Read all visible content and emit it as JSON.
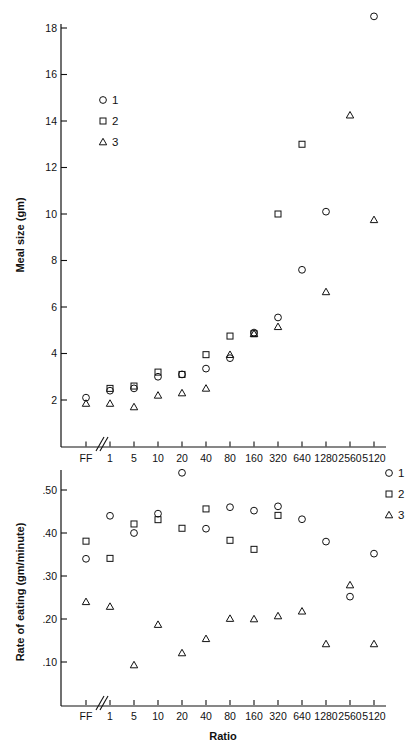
{
  "figure": {
    "xlabel": "Ratio",
    "background": "#ffffff",
    "ink": "#111111"
  },
  "chart_data": [
    {
      "id": "meal-size",
      "type": "scatter",
      "title": "",
      "xlabel": "",
      "ylabel": "Meal size (gm)",
      "x_tick_labels": [
        "FF",
        "1",
        "5",
        "10",
        "20",
        "40",
        "80",
        "160",
        "320",
        "640",
        "1280",
        "2560",
        "5120"
      ],
      "x_axis_break_after": "FF",
      "x_scale": "log2-categorical",
      "y_tick_labels": [
        "2",
        "4",
        "6",
        "8",
        "10",
        "12",
        "14",
        "16",
        "18"
      ],
      "y_tick_values": [
        2,
        4,
        6,
        8,
        10,
        12,
        14,
        16,
        18
      ],
      "ylim": [
        0,
        19
      ],
      "grid": false,
      "legend_position": "upper-left-inside",
      "legend": [
        {
          "label": "1",
          "marker": "circle"
        },
        {
          "label": "2",
          "marker": "square"
        },
        {
          "label": "3",
          "marker": "triangle"
        }
      ],
      "series": [
        {
          "name": "1",
          "marker": "circle",
          "points": [
            {
              "x": "FF",
              "y": 2.1
            },
            {
              "x": "1",
              "y": 2.4
            },
            {
              "x": "5",
              "y": 2.5
            },
            {
              "x": "10",
              "y": 3.0
            },
            {
              "x": "20",
              "y": 3.1
            },
            {
              "x": "40",
              "y": 3.35
            },
            {
              "x": "80",
              "y": 3.8
            },
            {
              "x": "160",
              "y": 4.9
            },
            {
              "x": "320",
              "y": 5.55
            },
            {
              "x": "640",
              "y": 7.6
            },
            {
              "x": "1280",
              "y": 10.1
            },
            {
              "x": "5120",
              "y": 18.5
            }
          ]
        },
        {
          "name": "2",
          "marker": "square",
          "points": [
            {
              "x": "1",
              "y": 2.5
            },
            {
              "x": "5",
              "y": 2.6
            },
            {
              "x": "10",
              "y": 3.2
            },
            {
              "x": "20",
              "y": 3.1
            },
            {
              "x": "40",
              "y": 3.95
            },
            {
              "x": "80",
              "y": 4.75
            },
            {
              "x": "160",
              "y": 4.85
            },
            {
              "x": "320",
              "y": 10.0
            },
            {
              "x": "640",
              "y": 13.0
            }
          ]
        },
        {
          "name": "3",
          "marker": "triangle",
          "points": [
            {
              "x": "FF",
              "y": 1.85
            },
            {
              "x": "1",
              "y": 1.85
            },
            {
              "x": "5",
              "y": 1.7
            },
            {
              "x": "10",
              "y": 2.2
            },
            {
              "x": "20",
              "y": 2.3
            },
            {
              "x": "40",
              "y": 2.5
            },
            {
              "x": "80",
              "y": 3.95
            },
            {
              "x": "160",
              "y": 4.85
            },
            {
              "x": "320",
              "y": 5.15
            },
            {
              "x": "1280",
              "y": 6.65
            },
            {
              "x": "2560",
              "y": 14.25
            },
            {
              "x": "5120",
              "y": 9.75
            }
          ]
        }
      ]
    },
    {
      "id": "rate-of-eating",
      "type": "scatter",
      "title": "",
      "xlabel": "Ratio",
      "ylabel": "Rate of eating (gm/minute)",
      "x_tick_labels": [
        "FF",
        "1",
        "5",
        "10",
        "20",
        "40",
        "80",
        "160",
        "320",
        "640",
        "1280",
        "2560",
        "5120"
      ],
      "x_axis_break_after": "FF",
      "x_scale": "log2-categorical",
      "y_tick_labels": [
        ".10",
        ".20",
        ".30",
        ".40",
        ".50"
      ],
      "y_tick_values": [
        0.1,
        0.2,
        0.3,
        0.4,
        0.5
      ],
      "ylim": [
        0.0,
        0.57
      ],
      "grid": false,
      "legend_position": "upper-right-outside",
      "legend": [
        {
          "label": "1",
          "marker": "circle"
        },
        {
          "label": "2",
          "marker": "square"
        },
        {
          "label": "3",
          "marker": "triangle"
        }
      ],
      "series": [
        {
          "name": "1",
          "marker": "circle",
          "points": [
            {
              "x": "FF",
              "y": 0.34
            },
            {
              "x": "1",
              "y": 0.44
            },
            {
              "x": "5",
              "y": 0.4
            },
            {
              "x": "10",
              "y": 0.445
            },
            {
              "x": "20",
              "y": 0.54
            },
            {
              "x": "40",
              "y": 0.41
            },
            {
              "x": "80",
              "y": 0.46
            },
            {
              "x": "160",
              "y": 0.452
            },
            {
              "x": "320",
              "y": 0.462
            },
            {
              "x": "640",
              "y": 0.432
            },
            {
              "x": "1280",
              "y": 0.38
            },
            {
              "x": "2560",
              "y": 0.252
            },
            {
              "x": "5120",
              "y": 0.352
            }
          ]
        },
        {
          "name": "2",
          "marker": "square",
          "points": [
            {
              "x": "FF",
              "y": 0.381
            },
            {
              "x": "1",
              "y": 0.341
            },
            {
              "x": "5",
              "y": 0.421
            },
            {
              "x": "10",
              "y": 0.431
            },
            {
              "x": "20",
              "y": 0.411
            },
            {
              "x": "40",
              "y": 0.456
            },
            {
              "x": "80",
              "y": 0.383
            },
            {
              "x": "160",
              "y": 0.362
            },
            {
              "x": "320",
              "y": 0.441
            }
          ]
        },
        {
          "name": "3",
          "marker": "triangle",
          "points": [
            {
              "x": "FF",
              "y": 0.24
            },
            {
              "x": "1",
              "y": 0.229
            },
            {
              "x": "5",
              "y": 0.093
            },
            {
              "x": "10",
              "y": 0.187
            },
            {
              "x": "20",
              "y": 0.121
            },
            {
              "x": "40",
              "y": 0.154
            },
            {
              "x": "80",
              "y": 0.201
            },
            {
              "x": "160",
              "y": 0.2
            },
            {
              "x": "320",
              "y": 0.207
            },
            {
              "x": "640",
              "y": 0.218
            },
            {
              "x": "1280",
              "y": 0.142
            },
            {
              "x": "2560",
              "y": 0.279
            },
            {
              "x": "5120",
              "y": 0.142
            }
          ]
        }
      ]
    }
  ]
}
